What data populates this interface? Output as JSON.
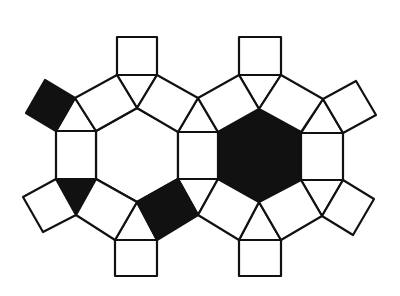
{
  "diagram": {
    "type": "tessellation",
    "colors": {
      "fill_dark": "#111111",
      "fill_light": "#ffffff",
      "stroke": "#111111"
    },
    "tiles": [
      {
        "name": "hexagon-left",
        "fill": "#ffffff",
        "points": "96,131 137,108 178,131 178,179 137,202 96,179"
      },
      {
        "name": "hexagon-right",
        "fill": "#111111",
        "points": "218,132 259,109 301,132 301,179 259,202 218,179"
      },
      {
        "name": "square-middle",
        "fill": "#ffffff",
        "points": "178,132 218,132 218,179 178,179"
      },
      {
        "name": "square-left",
        "fill": "#ffffff",
        "points": "56,131 96,131 96,179 56,179"
      },
      {
        "name": "square-right",
        "fill": "#ffffff",
        "points": "301,133 343,133 343,180 301,180"
      },
      {
        "name": "square-top-left",
        "fill": "#ffffff",
        "points": "117,37 157,37 157,75 117,75"
      },
      {
        "name": "square-top-right",
        "fill": "#ffffff",
        "points": "239,37 281,37 281,75 239,75"
      },
      {
        "name": "square-bottom-left",
        "fill": "#ffffff",
        "points": "115,240 157,240 157,276 115,276"
      },
      {
        "name": "square-bottom-right",
        "fill": "#ffffff",
        "points": "239,240 281,240 281,276 239,276"
      },
      {
        "name": "triangle-top-left",
        "fill": "#ffffff",
        "points": "117,75 157,75 137,108"
      },
      {
        "name": "triangle-top-right",
        "fill": "#ffffff",
        "points": "239,75 281,75 259,109"
      },
      {
        "name": "triangle-top-mid",
        "fill": "#ffffff",
        "points": "178,132 218,132 198,98"
      },
      {
        "name": "triangle-bottom-mid",
        "fill": "#ffffff",
        "points": "178,179 218,179 198,215"
      },
      {
        "name": "triangle-bottom-left",
        "fill": "#ffffff",
        "points": "115,240 157,240 137,202"
      },
      {
        "name": "triangle-bottom-right",
        "fill": "#ffffff",
        "points": "239,240 281,240 259,202"
      },
      {
        "name": "triangle-left-upper",
        "fill": "#ffffff",
        "points": "56,131 96,131 75,98"
      },
      {
        "name": "triangle-left-lower",
        "fill": "#111111",
        "points": "56,179 96,179 76,215"
      },
      {
        "name": "triangle-right-upper",
        "fill": "#ffffff",
        "points": "301,133 343,133 323,99"
      },
      {
        "name": "triangle-right-lower",
        "fill": "#ffffff",
        "points": "301,180 343,180 322,216"
      },
      {
        "name": "square-upper-left-edge",
        "fill": "#ffffff",
        "points": "75,98 117,75 137,108 96,131"
      },
      {
        "name": "square-upper-mid-left",
        "fill": "#ffffff",
        "points": "157,75 198,98 178,132 137,108"
      },
      {
        "name": "square-upper-mid-right",
        "fill": "#ffffff",
        "points": "198,98 239,75 259,109 218,132"
      },
      {
        "name": "square-upper-right-edge",
        "fill": "#ffffff",
        "points": "281,75 323,99 301,132 259,109"
      },
      {
        "name": "square-lower-left-edge",
        "fill": "#ffffff",
        "points": "96,179 137,202 115,240 76,215"
      },
      {
        "name": "square-lower-mid-left",
        "fill": "#111111",
        "points": "137,202 178,179 198,215 157,240"
      },
      {
        "name": "square-lower-mid-right",
        "fill": "#ffffff",
        "points": "218,179 259,202 239,240 198,215"
      },
      {
        "name": "square-lower-right-edge",
        "fill": "#ffffff",
        "points": "259,202 301,180 322,216 281,240"
      },
      {
        "name": "square-outer-left-upper",
        "fill": "#111111",
        "points": "45,80 75,98 56,131 26,113"
      },
      {
        "name": "square-outer-left-lower",
        "fill": "#ffffff",
        "points": "56,179 76,215 43,232 23,197"
      },
      {
        "name": "square-outer-right-upper",
        "fill": "#ffffff",
        "points": "323,99 356,81 376,115 343,133"
      },
      {
        "name": "square-outer-right-lower",
        "fill": "#ffffff",
        "points": "343,180 374,199 353,235 322,216"
      }
    ]
  }
}
